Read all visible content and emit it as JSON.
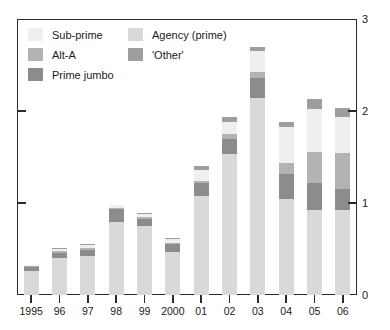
{
  "chart_data": {
    "type": "bar",
    "subtype": "stacked-vertical",
    "title": "",
    "subtitle": "",
    "xlabel": "",
    "ylabel": "",
    "ylim": [
      0,
      3
    ],
    "yticks": [
      0,
      1,
      2,
      3
    ],
    "ytick_labels": [
      "0",
      "1",
      "2",
      "3"
    ],
    "grid": false,
    "legend_position": "top-left-inside",
    "legend_columns": 2,
    "categories": [
      "1995",
      "96",
      "97",
      "98",
      "99",
      "2000",
      "01",
      "02",
      "03",
      "04",
      "05",
      "06"
    ],
    "stack_order_bottom_to_top": [
      "Agency (prime)",
      "Prime jumbo",
      "Alt-A",
      "Sub-prime",
      "'Other'"
    ],
    "series": [
      {
        "name": "Agency (prime)",
        "color": "#d9d9d9",
        "values": [
          0.26,
          0.4,
          0.42,
          0.79,
          0.75,
          0.47,
          1.08,
          1.53,
          2.14,
          1.04,
          0.92,
          0.92
        ]
      },
      {
        "name": "Prime jumbo",
        "color": "#8c8c8c",
        "values": [
          0.04,
          0.06,
          0.07,
          0.14,
          0.08,
          0.08,
          0.14,
          0.17,
          0.22,
          0.28,
          0.3,
          0.23
        ]
      },
      {
        "name": "Alt-A",
        "color": "#b3b3b3",
        "values": [
          0.01,
          0.02,
          0.02,
          0.02,
          0.02,
          0.02,
          0.02,
          0.05,
          0.06,
          0.12,
          0.33,
          0.39
        ]
      },
      {
        "name": "Sub-prime",
        "color": "#efefef",
        "values": [
          0.01,
          0.02,
          0.03,
          0.03,
          0.03,
          0.04,
          0.12,
          0.13,
          0.23,
          0.39,
          0.47,
          0.4
        ]
      },
      {
        "name": "'Other'",
        "color": "#9e9e9e",
        "values": [
          0.0,
          0.01,
          0.01,
          0.0,
          0.01,
          0.01,
          0.04,
          0.06,
          0.05,
          0.05,
          0.11,
          0.09
        ]
      }
    ],
    "totals": [
      0.32,
      0.51,
      0.55,
      0.98,
      0.89,
      0.62,
      1.4,
      1.94,
      2.7,
      1.88,
      2.13,
      2.03
    ]
  },
  "legend": {
    "items": [
      {
        "label": "Sub-prime",
        "color": "#efefef",
        "column": 1
      },
      {
        "label": "Alt-A",
        "color": "#b3b3b3",
        "column": 1
      },
      {
        "label": "Prime jumbo",
        "color": "#8c8c8c",
        "column": 1
      },
      {
        "label": "Agency (prime)",
        "color": "#d9d9d9",
        "column": 2
      },
      {
        "label": "'Other'",
        "color": "#9e9e9e",
        "column": 2
      }
    ]
  },
  "axis": {
    "color": "#2b2b2b"
  }
}
